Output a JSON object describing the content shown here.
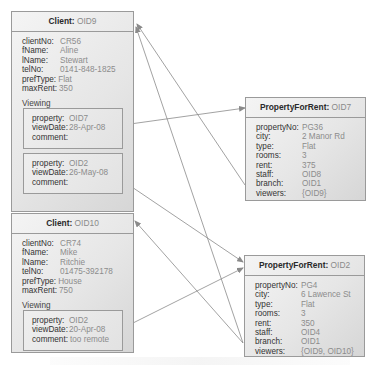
{
  "clients": [
    {
      "class": "Client:",
      "oid": "OID9",
      "attributes": [
        {
          "key": "clientNo:",
          "value": "CR56"
        },
        {
          "key": "fName:",
          "value": "Aline"
        },
        {
          "key": "lName:",
          "value": "Stewart"
        },
        {
          "key": "telNo:",
          "value": "0141-848-1825"
        },
        {
          "key": "prefType:",
          "value": "Flat"
        },
        {
          "key": "maxRent:",
          "value": "350"
        }
      ],
      "section_label": "Viewing",
      "viewings": [
        {
          "property_key": "property:",
          "property": "OID7",
          "date_key": "viewDate:",
          "viewDate": "28-Apr-08",
          "comment_key": "comment:",
          "comment": ""
        },
        {
          "property_key": "property:",
          "property": "OID2",
          "date_key": "viewDate:",
          "viewDate": "26-May-08",
          "comment_key": "comment:",
          "comment": ""
        }
      ]
    },
    {
      "class": "Client:",
      "oid": "OID10",
      "attributes": [
        {
          "key": "clientNo:",
          "value": "CR74"
        },
        {
          "key": "fName:",
          "value": "Mike"
        },
        {
          "key": "lName:",
          "value": "Ritchie"
        },
        {
          "key": "telNo:",
          "value": "01475-392178"
        },
        {
          "key": "prefType:",
          "value": "House"
        },
        {
          "key": "maxRent:",
          "value": "750"
        }
      ],
      "section_label": "Viewing",
      "viewings": [
        {
          "property_key": "property:",
          "property": "OID2",
          "date_key": "viewDate:",
          "viewDate": "20-Apr-08",
          "comment_key": "comment:",
          "comment": "too remote"
        }
      ]
    }
  ],
  "properties": [
    {
      "class": "PropertyForRent:",
      "oid": "OID7",
      "attributes": [
        {
          "key": "propertyNo:",
          "value": "PG36"
        },
        {
          "key": "city:",
          "value": "2 Manor Rd"
        },
        {
          "key": "type:",
          "value": "Flat"
        },
        {
          "key": "rooms:",
          "value": "3"
        },
        {
          "key": "rent:",
          "value": "375"
        },
        {
          "key": "staff:",
          "value": "OID8"
        },
        {
          "key": "branch:",
          "value": "OID1"
        },
        {
          "key": "viewers:",
          "value": "{OID9}"
        }
      ]
    },
    {
      "class": "PropertyForRent:",
      "oid": "OID2",
      "attributes": [
        {
          "key": "propertyNo:",
          "value": "PG4"
        },
        {
          "key": "city:",
          "value": "6 Lawence St"
        },
        {
          "key": "type:",
          "value": "Flat"
        },
        {
          "key": "rooms:",
          "value": "3"
        },
        {
          "key": "rent:",
          "value": "350"
        },
        {
          "key": "staff:",
          "value": "OID4"
        },
        {
          "key": "branch:",
          "value": "OID1"
        },
        {
          "key": "viewers:",
          "value": "{OID9, OID10}"
        }
      ]
    }
  ],
  "colors": {
    "line": "#8a8a8a",
    "border": "#9a9a9a",
    "value_text": "#8c8c8c"
  }
}
